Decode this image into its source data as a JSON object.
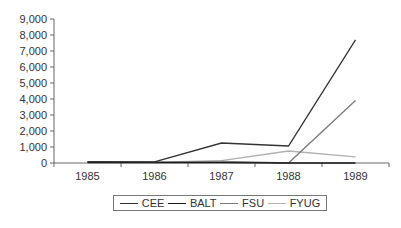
{
  "chart_data": {
    "type": "line",
    "title": "",
    "xlabel": "",
    "ylabel": "",
    "categories": [
      "1985",
      "1986",
      "1987",
      "1988",
      "1989"
    ],
    "ylim": [
      0,
      9000
    ],
    "yticks": [
      0,
      1000,
      2000,
      3000,
      4000,
      5000,
      6000,
      7000,
      8000,
      9000
    ],
    "ytick_labels": [
      "0",
      "1,000",
      "2,000",
      "3,000",
      "4,000",
      "5,000",
      "6,000",
      "7,000",
      "8,000",
      "9,000"
    ],
    "grid": false,
    "legend_position": "bottom",
    "series": [
      {
        "name": "CEE",
        "color": "#333333",
        "values": [
          80,
          70,
          1250,
          1060,
          7700
        ]
      },
      {
        "name": "BALT",
        "color": "#1a1a1a",
        "values": [
          30,
          30,
          20,
          0,
          0
        ]
      },
      {
        "name": "FSU",
        "color": "#7a7a7a",
        "values": [
          50,
          40,
          100,
          0,
          3900
        ]
      },
      {
        "name": "FYUG",
        "color": "#b0b0b0",
        "values": [
          60,
          50,
          150,
          750,
          380
        ]
      }
    ]
  },
  "legend": {
    "items": [
      {
        "label": "CEE",
        "color": "#333333"
      },
      {
        "label": "BALT",
        "color": "#1a1a1a"
      },
      {
        "label": "FSU",
        "color": "#7a7a7a"
      },
      {
        "label": "FYUG",
        "color": "#b0b0b0"
      }
    ]
  }
}
